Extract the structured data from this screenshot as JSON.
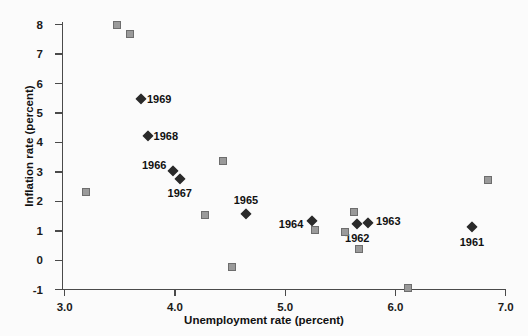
{
  "chart_data": {
    "type": "scatter",
    "title": "",
    "xlabel": "Unemployment rate (percent)",
    "ylabel": "Inflation rate (percent)",
    "xlim": [
      3.0,
      7.0
    ],
    "ylim": [
      -1,
      8
    ],
    "xticks": [
      "3.0",
      "4.0",
      "5.0",
      "6.0",
      "7.0"
    ],
    "xtick_values": [
      3.0,
      4.0,
      5.0,
      6.0,
      7.0
    ],
    "yticks": [
      "8",
      "7",
      "6",
      "5",
      "4",
      "3",
      "2",
      "1",
      "0",
      "-1"
    ],
    "ytick_values": [
      8,
      7,
      6,
      5,
      4,
      3,
      2,
      1,
      0,
      -1
    ],
    "grid": false,
    "legend": "none",
    "series": [
      {
        "name": "labeled-years",
        "marker": "diamond",
        "color": "#2a2a2a",
        "points": [
          {
            "label": "1969",
            "x": 3.7,
            "y": 5.45,
            "label_dx": 18,
            "label_dy": 0
          },
          {
            "label": "1968",
            "x": 3.76,
            "y": 4.2,
            "label_dx": 18,
            "label_dy": 0
          },
          {
            "label": "1966",
            "x": 3.99,
            "y": 3.0,
            "label_dx": -19,
            "label_dy": -6
          },
          {
            "label": "1967",
            "x": 4.05,
            "y": 2.75,
            "label_dx": 0,
            "label_dy": 14
          },
          {
            "label": "1965",
            "x": 4.65,
            "y": 1.55,
            "label_dx": 0,
            "label_dy": -14
          },
          {
            "label": "1964",
            "x": 5.25,
            "y": 1.32,
            "label_dx": -21,
            "label_dy": 3
          },
          {
            "label": "1962",
            "x": 5.66,
            "y": 1.2,
            "label_dx": 0,
            "label_dy": 14
          },
          {
            "label": "1963",
            "x": 5.76,
            "y": 1.25,
            "label_dx": 20,
            "label_dy": -2
          },
          {
            "label": "1961",
            "x": 6.7,
            "y": 1.1,
            "label_dx": 0,
            "label_dy": 15
          }
        ]
      },
      {
        "name": "unlabeled-points",
        "marker": "square",
        "color": "#9a9a9a",
        "points": [
          {
            "x": 3.2,
            "y": 2.3
          },
          {
            "x": 3.48,
            "y": 7.95
          },
          {
            "x": 3.6,
            "y": 7.65
          },
          {
            "x": 4.28,
            "y": 1.5
          },
          {
            "x": 4.44,
            "y": 3.35
          },
          {
            "x": 4.52,
            "y": -0.25
          },
          {
            "x": 5.28,
            "y": 1.0
          },
          {
            "x": 5.55,
            "y": 0.95
          },
          {
            "x": 5.63,
            "y": 1.6
          },
          {
            "x": 5.68,
            "y": 0.35
          },
          {
            "x": 6.12,
            "y": -0.95
          },
          {
            "x": 6.85,
            "y": 2.7
          }
        ]
      }
    ]
  }
}
